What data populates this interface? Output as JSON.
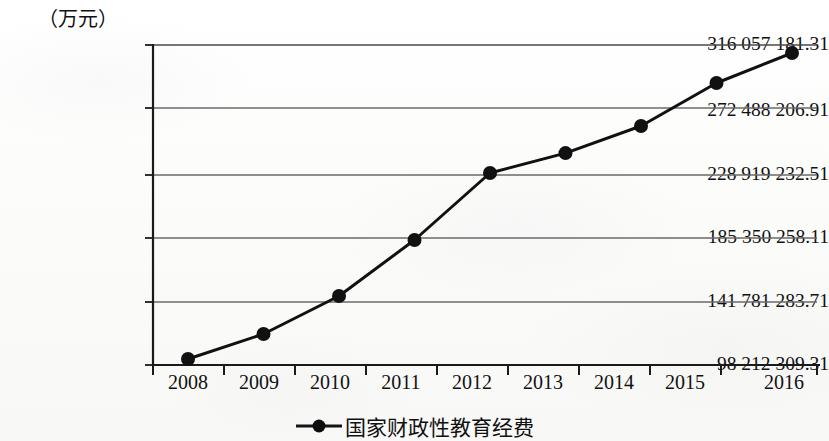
{
  "chart_data": {
    "type": "line",
    "title": "",
    "unit_label": "（万元）",
    "xlabel": "",
    "ylabel": "",
    "categories": [
      "2008",
      "2009",
      "2010",
      "2011",
      "2012",
      "2013",
      "2014",
      "2015",
      "2016"
    ],
    "x_tick_labels": [
      "2008",
      "2009",
      "2010",
      "2011",
      "2012",
      "2013",
      "2014",
      "2015",
      "2016"
    ],
    "y_tick_labels": [
      "98 212 309.31",
      "141 781 283.71",
      "185 350 258.11",
      "228 919 232.51",
      "272 488 206.91",
      "316 057 181.31"
    ],
    "y_tick_values": [
      98212309.31,
      141781283.71,
      185350258.11,
      228919232.51,
      272488206.91,
      316057181.31
    ],
    "ylim": [
      98212309.31,
      316057181.31
    ],
    "grid": true,
    "grid_axis": "y",
    "legend_position": "bottom",
    "series": [
      {
        "name": "国家财政性教育经费",
        "marker": "circle",
        "color": "#111111",
        "values": [
          102300000,
          119300000,
          145200000,
          183300000,
          228900000,
          242500000,
          260900000,
          290200000,
          310600000
        ]
      }
    ]
  },
  "legend": {
    "items": [
      {
        "label": "国家财政性教育经费",
        "marker": "line-circle-marker"
      }
    ]
  }
}
